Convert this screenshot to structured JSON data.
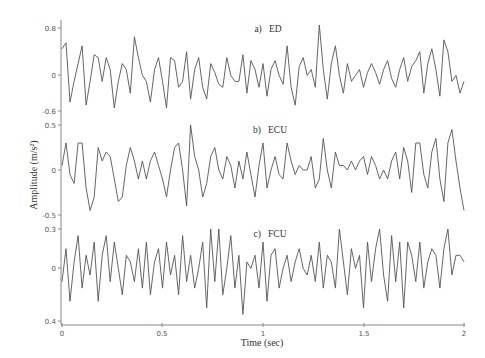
{
  "chart_data": [
    {
      "type": "line",
      "title": "a)  ED",
      "panel_label": "a)",
      "panel_name": "ED",
      "xlabel": "Time (sec)",
      "ylabel": "Amplitude (m/s^2)",
      "xlim": [
        0,
        2
      ],
      "ylim": [
        -0.6,
        0.8
      ],
      "yticks": [
        "0.8",
        "0",
        "-0.6"
      ],
      "grid": false,
      "color": "#555555",
      "x": [
        0.0,
        0.02,
        0.04,
        0.06,
        0.08,
        0.1,
        0.12,
        0.14,
        0.16,
        0.18,
        0.2,
        0.22,
        0.24,
        0.26,
        0.28,
        0.3,
        0.32,
        0.34,
        0.36,
        0.38,
        0.4,
        0.42,
        0.44,
        0.46,
        0.48,
        0.5,
        0.52,
        0.54,
        0.56,
        0.58,
        0.6,
        0.62,
        0.64,
        0.66,
        0.68,
        0.7,
        0.72,
        0.74,
        0.76,
        0.78,
        0.8,
        0.82,
        0.84,
        0.86,
        0.88,
        0.9,
        0.92,
        0.94,
        0.96,
        0.98,
        1.0,
        1.02,
        1.04,
        1.06,
        1.08,
        1.1,
        1.12,
        1.14,
        1.16,
        1.18,
        1.2,
        1.22,
        1.24,
        1.26,
        1.28,
        1.3,
        1.32,
        1.34,
        1.36,
        1.38,
        1.4,
        1.42,
        1.44,
        1.46,
        1.48,
        1.5,
        1.52,
        1.54,
        1.56,
        1.58,
        1.6,
        1.62,
        1.64,
        1.66,
        1.68,
        1.7,
        1.72,
        1.74,
        1.76,
        1.78,
        1.8,
        1.82,
        1.84,
        1.86,
        1.88,
        1.9,
        1.92,
        1.94,
        1.96,
        1.98,
        2.0
      ],
      "values": [
        0.45,
        0.55,
        -0.45,
        -0.1,
        0.2,
        0.5,
        -0.5,
        -0.1,
        0.35,
        0.3,
        -0.1,
        0.3,
        0.1,
        -0.55,
        -0.1,
        0.2,
        0.1,
        -0.3,
        0.65,
        0.3,
        0.0,
        -0.1,
        -0.45,
        0.1,
        0.3,
        -0.1,
        -0.55,
        0.3,
        0.25,
        -0.2,
        -0.1,
        0.4,
        -0.4,
        0.1,
        0.3,
        -0.2,
        -0.4,
        0.2,
        0.05,
        -0.15,
        -0.2,
        0.3,
        0.0,
        -0.1,
        -0.1,
        0.35,
        -0.3,
        0.25,
        0.1,
        -0.2,
        0.2,
        -0.35,
        0.1,
        0.25,
        0.0,
        -0.15,
        0.5,
        -0.2,
        -0.5,
        0.15,
        0.3,
        0.0,
        0.1,
        -0.2,
        0.85,
        0.1,
        -0.4,
        0.2,
        0.5,
        0.0,
        -0.3,
        0.2,
        -0.1,
        0.0,
        0.1,
        -0.2,
        0.05,
        0.2,
        0.05,
        -0.15,
        0.1,
        0.25,
        -0.05,
        -0.2,
        0.1,
        0.3,
        -0.1,
        0.15,
        0.25,
        0.4,
        -0.3,
        0.2,
        0.45,
        0.1,
        -0.35,
        0.6,
        0.4,
        -0.1,
        0.0,
        -0.3,
        -0.1
      ]
    },
    {
      "type": "line",
      "title": "b)  ECU",
      "panel_label": "b)",
      "panel_name": "ECU",
      "xlabel": "Time (sec)",
      "ylabel": "Amplitude (m/s^2)",
      "xlim": [
        0,
        2
      ],
      "ylim": [
        -0.5,
        0.5
      ],
      "yticks": [
        "0.5",
        "0",
        "-0.5"
      ],
      "grid": false,
      "color": "#555555",
      "x": [
        0.0,
        0.02,
        0.04,
        0.06,
        0.08,
        0.1,
        0.12,
        0.14,
        0.16,
        0.18,
        0.2,
        0.22,
        0.24,
        0.26,
        0.28,
        0.3,
        0.32,
        0.34,
        0.36,
        0.38,
        0.4,
        0.42,
        0.44,
        0.46,
        0.48,
        0.5,
        0.52,
        0.54,
        0.56,
        0.58,
        0.6,
        0.62,
        0.64,
        0.66,
        0.68,
        0.7,
        0.72,
        0.74,
        0.76,
        0.78,
        0.8,
        0.82,
        0.84,
        0.86,
        0.88,
        0.9,
        0.92,
        0.94,
        0.96,
        0.98,
        1.0,
        1.02,
        1.04,
        1.06,
        1.08,
        1.1,
        1.12,
        1.14,
        1.16,
        1.18,
        1.2,
        1.22,
        1.24,
        1.26,
        1.28,
        1.3,
        1.32,
        1.34,
        1.36,
        1.38,
        1.4,
        1.42,
        1.44,
        1.46,
        1.48,
        1.5,
        1.52,
        1.54,
        1.56,
        1.58,
        1.6,
        1.62,
        1.64,
        1.66,
        1.68,
        1.7,
        1.72,
        1.74,
        1.76,
        1.78,
        1.8,
        1.82,
        1.84,
        1.86,
        1.88,
        1.9,
        1.92,
        1.94,
        1.96,
        1.98,
        2.0
      ],
      "values": [
        0.05,
        0.3,
        -0.05,
        -0.15,
        0.3,
        0.3,
        -0.2,
        -0.45,
        -0.3,
        0.25,
        0.1,
        0.2,
        0.15,
        -0.1,
        -0.35,
        -0.3,
        0.05,
        0.25,
        0.1,
        -0.1,
        0.1,
        -0.1,
        0.1,
        0.2,
        0.05,
        -0.1,
        -0.3,
        0.0,
        0.25,
        0.3,
        0.0,
        -0.4,
        0.5,
        0.15,
        0.0,
        -0.3,
        -0.15,
        0.15,
        0.25,
        0.0,
        -0.1,
        0.15,
        0.05,
        -0.2,
        0.1,
        -0.1,
        0.2,
        -0.05,
        -0.3,
        0.05,
        0.3,
        -0.2,
        0.0,
        0.15,
        -0.05,
        -0.1,
        0.3,
        0.1,
        -0.05,
        0.05,
        0.0,
        0.0,
        0.15,
        -0.2,
        -0.1,
        0.35,
        0.0,
        -0.2,
        0.2,
        0.05,
        0.05,
        0.0,
        0.1,
        0.0,
        0.1,
        0.15,
        -0.05,
        0.15,
        0.05,
        -0.1,
        0.0,
        -0.1,
        0.1,
        0.2,
        -0.1,
        0.25,
        0.1,
        -0.25,
        0.3,
        0.3,
        -0.05,
        -0.2,
        0.2,
        0.35,
        -0.1,
        -0.35,
        0.3,
        0.45,
        0.1,
        -0.2,
        -0.45
      ]
    },
    {
      "type": "line",
      "title": "c)  FCU",
      "panel_label": "c)",
      "panel_name": "FCU",
      "xlabel": "Time (sec)",
      "ylabel": "Amplitude (m/s^2)",
      "xlim": [
        0,
        2
      ],
      "ylim": [
        -0.4,
        0.3
      ],
      "yticks": [
        "0.3",
        "0",
        "0.4"
      ],
      "grid": false,
      "color": "#555555",
      "x": [
        0.0,
        0.02,
        0.04,
        0.06,
        0.08,
        0.1,
        0.12,
        0.14,
        0.16,
        0.18,
        0.2,
        0.22,
        0.24,
        0.26,
        0.28,
        0.3,
        0.32,
        0.34,
        0.36,
        0.38,
        0.4,
        0.42,
        0.44,
        0.46,
        0.48,
        0.5,
        0.52,
        0.54,
        0.56,
        0.58,
        0.6,
        0.62,
        0.64,
        0.66,
        0.68,
        0.7,
        0.72,
        0.74,
        0.76,
        0.78,
        0.8,
        0.82,
        0.84,
        0.86,
        0.88,
        0.9,
        0.92,
        0.94,
        0.96,
        0.98,
        1.0,
        1.02,
        1.04,
        1.06,
        1.08,
        1.1,
        1.12,
        1.14,
        1.16,
        1.18,
        1.2,
        1.22,
        1.24,
        1.26,
        1.28,
        1.3,
        1.32,
        1.34,
        1.36,
        1.38,
        1.4,
        1.42,
        1.44,
        1.46,
        1.48,
        1.5,
        1.52,
        1.54,
        1.56,
        1.58,
        1.6,
        1.62,
        1.64,
        1.66,
        1.68,
        1.7,
        1.72,
        1.74,
        1.76,
        1.78,
        1.8,
        1.82,
        1.84,
        1.86,
        1.88,
        1.9,
        1.92,
        1.94,
        1.96,
        1.98,
        2.0
      ],
      "values": [
        -0.1,
        0.15,
        -0.25,
        0.05,
        0.25,
        -0.15,
        0.1,
        -0.05,
        0.2,
        -0.25,
        0.1,
        0.25,
        -0.1,
        0.2,
        0.0,
        -0.2,
        0.1,
        0.05,
        -0.1,
        0.15,
        -0.15,
        0.2,
        -0.2,
        0.05,
        0.15,
        -0.15,
        0.2,
        -0.05,
        0.1,
        -0.2,
        0.25,
        -0.1,
        0.1,
        -0.15,
        0.0,
        0.2,
        -0.3,
        0.3,
        -0.1,
        0.3,
        -0.2,
        0.0,
        0.25,
        -0.15,
        0.1,
        -0.35,
        0.05,
        0.0,
        0.1,
        -0.15,
        0.2,
        -0.25,
        0.1,
        0.15,
        -0.15,
        0.0,
        0.1,
        -0.1,
        0.05,
        0.15,
        0.0,
        -0.05,
        0.1,
        -0.1,
        0.2,
        -0.15,
        0.1,
        0.05,
        -0.15,
        0.3,
        0.05,
        -0.2,
        0.15,
        0.0,
        0.1,
        -0.3,
        0.2,
        -0.1,
        0.15,
        0.3,
        -0.05,
        -0.25,
        0.25,
        -0.1,
        0.2,
        -0.3,
        0.2,
        0.1,
        -0.1,
        0.2,
        -0.15,
        0.05,
        0.15,
        0.1,
        -0.15,
        0.15,
        0.3,
        -0.05,
        0.1,
        0.1,
        0.05
      ]
    }
  ],
  "labels": {
    "panel_a": "a)   ED",
    "panel_b": "b)   ECU",
    "panel_c": "c)   FCU",
    "ylabel": "Amplitude (m/s²)",
    "xlabel": "Time (sec)",
    "a_ticks": [
      "0.8",
      "0",
      "-0.6"
    ],
    "b_ticks": [
      "0.5",
      "0",
      "-0.5"
    ],
    "c_ticks": [
      "0.3",
      "0",
      "0.4"
    ],
    "x_ticks": [
      "0",
      "0.5",
      "1",
      "1.5",
      "2"
    ]
  }
}
